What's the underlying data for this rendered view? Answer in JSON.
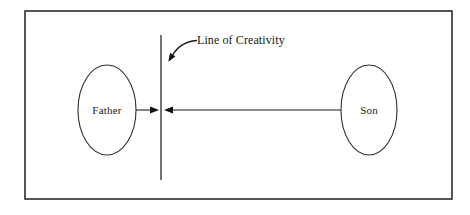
{
  "diagram": {
    "type": "concept-diagram",
    "frame": {
      "x": 25,
      "y": 11,
      "width": 427,
      "height": 188,
      "border_color": "#2b2b2b",
      "background_color": "#ffffff"
    },
    "nodes": [
      {
        "id": "father",
        "label": "Father",
        "shape": "ellipse",
        "cx": 107,
        "cy": 110,
        "rx": 29,
        "ry": 45
      },
      {
        "id": "son",
        "label": "Son",
        "shape": "ellipse",
        "cx": 369,
        "cy": 110,
        "rx": 28,
        "ry": 45
      }
    ],
    "divider": {
      "id": "line-of-creativity",
      "label": "Line of Creativity",
      "x": 161,
      "y_top": 35,
      "y_bottom": 180,
      "color": "#3a3a3a"
    },
    "connectors": [
      {
        "id": "father-to-line",
        "from": "father",
        "to": "line-of-creativity",
        "direction": "right",
        "x_start": 136,
        "x_end": 159,
        "y": 110
      },
      {
        "id": "son-to-line",
        "from": "son",
        "to": "line-of-creativity",
        "direction": "left",
        "x_start": 341,
        "x_end": 164,
        "y": 110
      }
    ],
    "annotation": {
      "id": "line-of-creativity-callout",
      "text": "Line of Creativity",
      "text_x": 197,
      "text_y": 41,
      "leader": {
        "style": "curved-arrow",
        "tip_x": 168,
        "tip_y": 61,
        "tail_x": 196,
        "tail_y": 40
      }
    }
  }
}
